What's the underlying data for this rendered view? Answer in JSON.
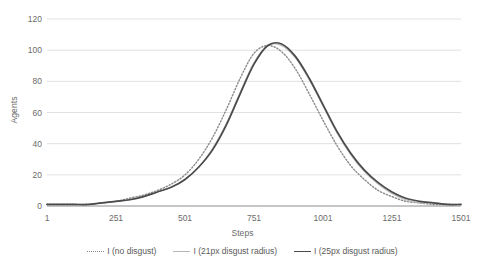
{
  "chart_data": {
    "type": "line",
    "title": "",
    "xlabel": "Steps",
    "ylabel": "Agents",
    "xlim": [
      1,
      1501
    ],
    "ylim": [
      0,
      120
    ],
    "grid": true,
    "legend_position": "bottom",
    "xticks": [
      "1",
      "251",
      "501",
      "751",
      "1001",
      "1251",
      "1501"
    ],
    "xtick_values": [
      1,
      251,
      501,
      751,
      1001,
      1251,
      1501
    ],
    "yticks": [
      "0",
      "20",
      "40",
      "60",
      "80",
      "100",
      "120"
    ],
    "ytick_values": [
      0,
      20,
      40,
      60,
      80,
      100,
      120
    ],
    "x": [
      1,
      51,
      101,
      151,
      201,
      251,
      301,
      351,
      401,
      451,
      501,
      551,
      601,
      651,
      701,
      751,
      801,
      851,
      901,
      951,
      1001,
      1051,
      1101,
      1151,
      1201,
      1251,
      1301,
      1351,
      1401,
      1451,
      1501
    ],
    "series": [
      {
        "name": "I (no disgust)",
        "style": "dotted",
        "color": "#8a8a8a",
        "values": [
          1,
          1,
          1,
          1,
          2,
          3,
          5,
          7,
          10,
          14,
          20,
          30,
          44,
          62,
          82,
          98,
          103,
          99,
          88,
          72,
          55,
          39,
          26,
          17,
          10,
          6,
          3,
          2,
          1,
          1,
          1
        ]
      },
      {
        "name": "I (21px disgust radius)",
        "style": "thin-solid",
        "color": "#b6b6b6",
        "values": [
          1,
          1,
          1,
          1,
          2,
          3,
          4,
          6,
          9,
          12,
          17,
          25,
          37,
          53,
          73,
          92,
          103,
          103,
          95,
          81,
          64,
          47,
          33,
          22,
          14,
          8,
          4,
          2,
          2,
          1,
          1
        ]
      },
      {
        "name": "I (25px disgust radius)",
        "style": "thick-solid",
        "color": "#4a4a4a",
        "values": [
          1,
          1,
          1,
          1,
          2,
          3,
          4,
          6,
          9,
          12,
          17,
          25,
          36,
          52,
          72,
          91,
          103,
          104,
          96,
          82,
          65,
          48,
          34,
          23,
          15,
          9,
          5,
          3,
          2,
          1,
          1
        ]
      }
    ]
  },
  "legend": {
    "items": [
      {
        "label": "I (no disgust)",
        "marker": "dotted-line-icon"
      },
      {
        "label": "I (21px disgust radius)",
        "marker": "thin-line-icon"
      },
      {
        "label": "I (25px disgust radius)",
        "marker": "thick-line-icon"
      }
    ]
  }
}
